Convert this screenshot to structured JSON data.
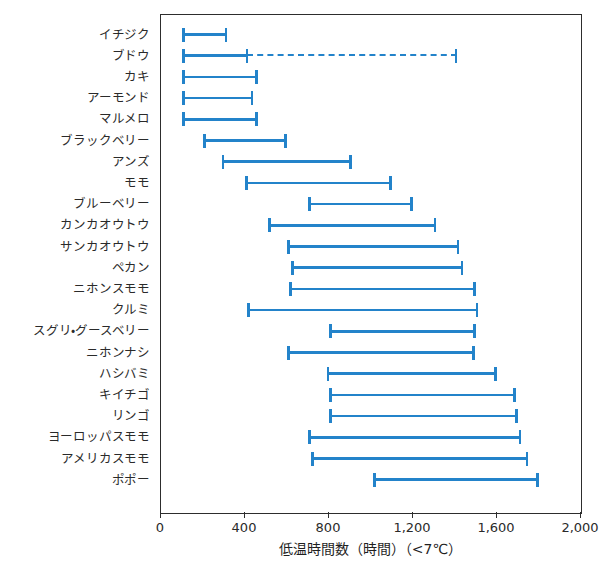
{
  "chart_data": {
    "type": "bar",
    "subtype": "range-interval (floating bar / gantt-style)",
    "title": "",
    "xlabel": "低温時間数（時間）（<7℃）",
    "ylabel": "",
    "xlim": [
      0,
      2000
    ],
    "xticks": [
      0,
      400,
      800,
      1200,
      1600,
      2000
    ],
    "xtick_labels": [
      "0",
      "400",
      "800",
      "1,200",
      "1,600",
      "2,000"
    ],
    "grid": false,
    "legend": false,
    "series_color": "#2383ca",
    "categories": [
      "イチジク",
      "ブドウ",
      "カキ",
      "アーモンド",
      "マルメロ",
      "ブラックベリー",
      "アンズ",
      "モモ",
      "ブルーベリー",
      "カンカオウトウ",
      "サンカオウトウ",
      "ペカン",
      "ニホンスモモ",
      "クルミ",
      "スグリ・グースベリー",
      "ニホンナシ",
      "ハシバミ",
      "キイチゴ",
      "リンゴ",
      "ヨーロッパスモモ",
      "アメリカスモモ",
      "ポポー"
    ],
    "ranges": [
      {
        "category": "イチジク",
        "low": 100,
        "high": 315,
        "style": "solid"
      },
      {
        "category": "ブドウ",
        "low": 100,
        "high": 410,
        "style": "solid",
        "extended_high": 1410,
        "extended_style": "dashed"
      },
      {
        "category": "カキ",
        "low": 100,
        "high": 460,
        "style": "solid"
      },
      {
        "category": "アーモンド",
        "low": 100,
        "high": 440,
        "style": "solid"
      },
      {
        "category": "マルメロ",
        "low": 100,
        "high": 460,
        "style": "solid"
      },
      {
        "category": "ブラックベリー",
        "low": 200,
        "high": 600,
        "style": "solid"
      },
      {
        "category": "アンズ",
        "low": 290,
        "high": 910,
        "style": "solid"
      },
      {
        "category": "モモ",
        "low": 400,
        "high": 1100,
        "style": "solid"
      },
      {
        "category": "ブルーベリー",
        "low": 700,
        "high": 1200,
        "style": "solid"
      },
      {
        "category": "カンカオウトウ",
        "low": 510,
        "high": 1310,
        "style": "solid"
      },
      {
        "category": "サンカオウトウ",
        "low": 600,
        "high": 1420,
        "style": "solid"
      },
      {
        "category": "ペカン",
        "low": 620,
        "high": 1440,
        "style": "solid"
      },
      {
        "category": "ニホンスモモ",
        "low": 610,
        "high": 1500,
        "style": "solid"
      },
      {
        "category": "クルミ",
        "low": 410,
        "high": 1510,
        "style": "solid"
      },
      {
        "category": "スグリ・グースベリー",
        "low": 800,
        "high": 1500,
        "style": "solid"
      },
      {
        "category": "ニホンナシ",
        "low": 600,
        "high": 1495,
        "style": "solid"
      },
      {
        "category": "ハシバミ",
        "low": 790,
        "high": 1600,
        "style": "solid"
      },
      {
        "category": "キイチゴ",
        "low": 800,
        "high": 1690,
        "style": "solid"
      },
      {
        "category": "リンゴ",
        "low": 800,
        "high": 1700,
        "style": "solid"
      },
      {
        "category": "ヨーロッパスモモ",
        "low": 700,
        "high": 1715,
        "style": "solid"
      },
      {
        "category": "アメリカスモモ",
        "low": 715,
        "high": 1750,
        "style": "solid"
      },
      {
        "category": "ポポー",
        "low": 1010,
        "high": 1800,
        "style": "solid"
      }
    ]
  }
}
